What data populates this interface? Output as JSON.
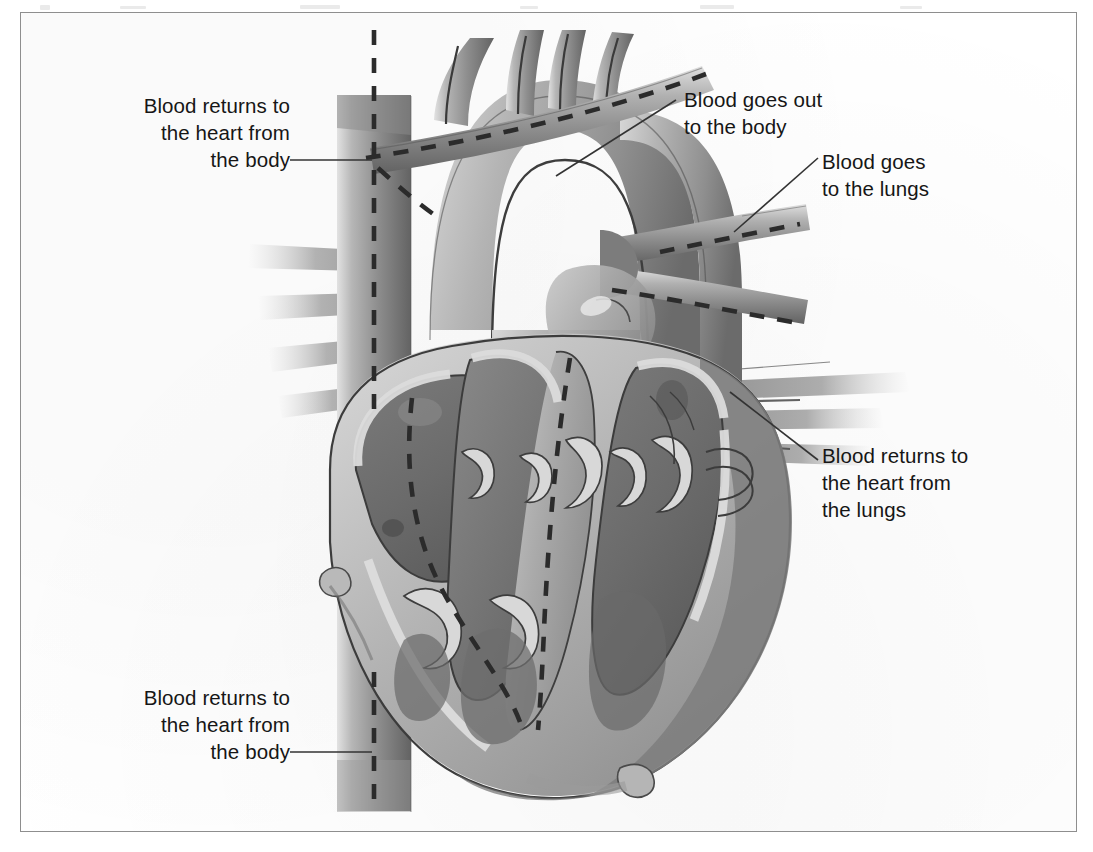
{
  "figure": {
    "kind": "anatomical-illustration",
    "style": "grayscale halftone line-and-wash drawing inside a thin rectangular frame",
    "frame_color": "#8e8e8e",
    "background_color": "#ffffff",
    "ink_color": "#161616"
  },
  "callouts": [
    {
      "id": "return-body-upper",
      "text": "Blood returns to\nthe heart from\nthe body",
      "align": "right",
      "points_to": "superior vena cava",
      "leader": "horizontal line from text to the descending vena cava trunk"
    },
    {
      "id": "out-to-body",
      "text": "Blood goes out\nto the body",
      "align": "left",
      "points_to": "aorta / aortic arch",
      "leader": "diagonal line down-left to the aortic arch"
    },
    {
      "id": "to-lungs",
      "text": "Blood goes\nto the lungs",
      "align": "left",
      "points_to": "pulmonary artery",
      "leader": "diagonal line down-left to the right pulmonary artery branch"
    },
    {
      "id": "return-lungs",
      "text": "Blood returns to\nthe heart from\nthe lungs",
      "align": "left",
      "points_to": "pulmonary veins",
      "leader": "diagonal line up-left to the right pulmonary veins"
    },
    {
      "id": "return-body-lower",
      "text": "Blood returns to\nthe heart from\nthe body",
      "align": "right",
      "points_to": "inferior vena cava",
      "leader": "horizontal line from text to the inferior vena cava trunk"
    }
  ],
  "flow_indicators": {
    "style": "dashed dark lines showing direction of blood flow",
    "paths": [
      "vertical dashed line down the vena cava (venous return from body)",
      "dashed line along the aortic arch heading out to the body",
      "dashed line into the pulmonary artery branches toward the lungs",
      "dashed line through the right atrium and right ventricle"
    ]
  },
  "anatomy_parts": [
    "aorta",
    "aortic arch",
    "brachiocephalic branches",
    "superior vena cava",
    "inferior vena cava",
    "pulmonary artery",
    "pulmonary artery branches",
    "pulmonary veins",
    "right atrium",
    "right ventricle",
    "left atrium",
    "left ventricle",
    "interventricular septum",
    "tricuspid valve leaflets",
    "mitral valve leaflets",
    "papillary muscles",
    "chordae tendineae",
    "myocardium wall",
    "coronary artery",
    "heart apex"
  ],
  "palette": {
    "paper": "#ffffff",
    "frame": "#8e8e8e",
    "wall_light": "#cfcfcf",
    "wall_mid": "#a8a8a8",
    "wall_dark": "#7d7d7d",
    "cavity_dark": "#6f6f6f",
    "cavity_darker": "#5e5e5e",
    "vessel_light": "#bdbdbd",
    "vessel_mid": "#9a9a9a",
    "vessel_dark": "#6a6a6a",
    "endocardium": "#d8d8d8",
    "outline": "#3a3a3a",
    "dash": "#2b2b2b"
  }
}
